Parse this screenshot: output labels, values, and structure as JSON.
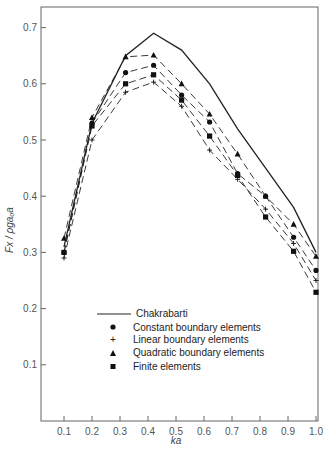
{
  "chart_data": {
    "type": "line",
    "title": "",
    "xlabel": "ka",
    "ylabel": "Fx / ρgaₒa",
    "xlim": [
      0.0,
      1.0
    ],
    "ylim": [
      0.0,
      0.7
    ],
    "grid": false,
    "legend_position": "lower center (inside plot)",
    "x_ticks": [
      "0.1",
      "0.2",
      "0.3",
      "0.4",
      "0.5",
      "0.6",
      "0.7",
      "0.8",
      "0.9",
      "1.0"
    ],
    "y_ticks": [
      "0.1",
      "0.2",
      "0.3",
      "0.4",
      "0.5",
      "0.6",
      "0.7"
    ],
    "series": [
      {
        "name": "Chakrabarti",
        "style": "solid line",
        "x": [
          0.1,
          0.2,
          0.32,
          0.42,
          0.52,
          0.62,
          0.72,
          0.82,
          0.92,
          1.0
        ],
        "values": [
          0.31,
          0.53,
          0.65,
          0.69,
          0.66,
          0.6,
          0.52,
          0.45,
          0.38,
          0.3
        ]
      },
      {
        "name": "Constant boundary elements",
        "marker": "circle",
        "style": "dashed",
        "x": [
          0.1,
          0.2,
          0.32,
          0.42,
          0.52,
          0.62,
          0.72,
          0.82,
          0.92,
          1.0
        ],
        "values": [
          0.3,
          0.53,
          0.62,
          0.633,
          0.58,
          0.532,
          0.44,
          0.4,
          0.327,
          0.268
        ]
      },
      {
        "name": "Linear boundary elements",
        "marker": "plus",
        "style": "dashed",
        "x": [
          0.1,
          0.2,
          0.32,
          0.42,
          0.52,
          0.62,
          0.72,
          0.82,
          0.92,
          1.0
        ],
        "values": [
          0.29,
          0.5,
          0.585,
          0.603,
          0.56,
          0.482,
          0.43,
          0.377,
          0.316,
          0.25
        ]
      },
      {
        "name": "Quadratic boundary elements",
        "marker": "triangle",
        "style": "dashed",
        "x": [
          0.1,
          0.2,
          0.32,
          0.42,
          0.52,
          0.62,
          0.72,
          0.82,
          0.92,
          1.0
        ],
        "values": [
          0.325,
          0.54,
          0.648,
          0.651,
          0.6,
          0.546,
          0.475,
          0.4,
          0.35,
          0.293
        ]
      },
      {
        "name": "Finite elements",
        "marker": "square",
        "style": "dashed",
        "x": [
          0.1,
          0.2,
          0.32,
          0.42,
          0.52,
          0.62,
          0.72,
          0.82,
          0.92,
          1.0
        ],
        "values": [
          0.3,
          0.525,
          0.6,
          0.616,
          0.571,
          0.507,
          0.437,
          0.363,
          0.302,
          0.229
        ]
      }
    ]
  },
  "legend": {
    "chakrabarti": "Chakrabarti",
    "constant": "Constant boundary elements",
    "linear": "Linear boundary elements",
    "quadratic": "Quadratic boundary elements",
    "finite": "Finite elements"
  },
  "axes": {
    "xlabel": "ka",
    "ylabel": "Fx / ρgaₒa"
  }
}
